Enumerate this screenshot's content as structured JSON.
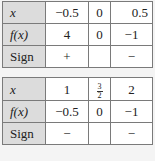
{
  "tables": [
    {
      "rows": [
        {
          "label": "x",
          "values": [
            "−0.5",
            "0",
            "0.5"
          ]
        },
        {
          "label": "f(x)",
          "values": [
            "4",
            "0",
            "−1"
          ]
        },
        {
          "label": "Sign",
          "values": [
            "+",
            "",
            "−"
          ]
        }
      ]
    },
    {
      "rows": [
        {
          "label": "x",
          "values": [
            "1",
            "3/2",
            "2"
          ],
          "fraction": {
            "num": "3",
            "den": "2"
          }
        },
        {
          "label": "f(x)",
          "values": [
            "−0.5",
            "0",
            "−1"
          ]
        },
        {
          "label": "Sign",
          "values": [
            "−",
            "",
            "−"
          ]
        }
      ]
    }
  ]
}
